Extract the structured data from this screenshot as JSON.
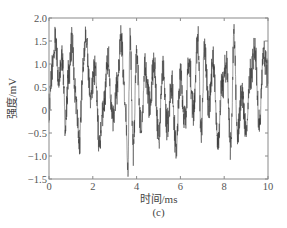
{
  "chart_data": {
    "type": "line",
    "title": "",
    "caption": "(c)",
    "xlabel": "时间/ms",
    "ylabel": "强度/mV",
    "xlim": [
      0,
      10
    ],
    "ylim": [
      -1.5,
      2.0
    ],
    "xticks": [
      0,
      2,
      4,
      6,
      8,
      10
    ],
    "xtick_labels": [
      "0",
      "2",
      "4",
      "6",
      "8",
      "10"
    ],
    "yticks": [
      -1.5,
      -1.0,
      -0.5,
      0,
      0.5,
      1.0,
      1.5,
      2.0
    ],
    "ytick_labels": [
      "-1.5",
      "-1.0",
      "-0.5",
      "0",
      "0.5",
      "1.0",
      "1.5",
      "2.0"
    ],
    "grid": false,
    "legend": null,
    "line_color": "#3a3a3a",
    "series": [
      {
        "name": "signal",
        "description": "Noisy oscillating voltage signal, mostly between -0.8 and 1.5 mV, peaks up to ~1.7 mV, dips to ~-1.3 mV",
        "envelope_points": [
          {
            "x": 0.0,
            "y": 0.0
          },
          {
            "x": 0.15,
            "y": 0.9
          },
          {
            "x": 0.3,
            "y": 1.5
          },
          {
            "x": 0.45,
            "y": 0.6
          },
          {
            "x": 0.6,
            "y": 1.2
          },
          {
            "x": 0.75,
            "y": -0.3
          },
          {
            "x": 0.9,
            "y": 0.8
          },
          {
            "x": 1.05,
            "y": 1.5
          },
          {
            "x": 1.2,
            "y": 0.3
          },
          {
            "x": 1.4,
            "y": -0.7
          },
          {
            "x": 1.55,
            "y": 1.0
          },
          {
            "x": 1.7,
            "y": 1.6
          },
          {
            "x": 1.9,
            "y": 0.2
          },
          {
            "x": 2.1,
            "y": 0.9
          },
          {
            "x": 2.3,
            "y": -0.7
          },
          {
            "x": 2.5,
            "y": 0.1
          },
          {
            "x": 2.7,
            "y": 1.1
          },
          {
            "x": 2.9,
            "y": -0.2
          },
          {
            "x": 3.1,
            "y": 0.5
          },
          {
            "x": 3.3,
            "y": 1.5
          },
          {
            "x": 3.5,
            "y": 0.0
          },
          {
            "x": 3.6,
            "y": -1.3
          },
          {
            "x": 3.7,
            "y": 1.7
          },
          {
            "x": 3.85,
            "y": -0.9
          },
          {
            "x": 4.0,
            "y": 1.2
          },
          {
            "x": 4.2,
            "y": -0.4
          },
          {
            "x": 4.4,
            "y": 0.9
          },
          {
            "x": 4.6,
            "y": 0.1
          },
          {
            "x": 4.8,
            "y": 1.0
          },
          {
            "x": 5.0,
            "y": -0.6
          },
          {
            "x": 5.2,
            "y": 0.8
          },
          {
            "x": 5.4,
            "y": -0.3
          },
          {
            "x": 5.6,
            "y": 0.6
          },
          {
            "x": 5.8,
            "y": -0.8
          },
          {
            "x": 6.0,
            "y": 0.7
          },
          {
            "x": 6.2,
            "y": -0.2
          },
          {
            "x": 6.4,
            "y": 1.0
          },
          {
            "x": 6.6,
            "y": 0.0
          },
          {
            "x": 6.8,
            "y": 1.6
          },
          {
            "x": 6.95,
            "y": -0.5
          },
          {
            "x": 7.1,
            "y": 1.3
          },
          {
            "x": 7.3,
            "y": 0.1
          },
          {
            "x": 7.5,
            "y": 1.1
          },
          {
            "x": 7.7,
            "y": -0.7
          },
          {
            "x": 7.9,
            "y": 0.5
          },
          {
            "x": 8.1,
            "y": 1.0
          },
          {
            "x": 8.3,
            "y": -0.8
          },
          {
            "x": 8.45,
            "y": 1.6
          },
          {
            "x": 8.6,
            "y": -0.6
          },
          {
            "x": 8.8,
            "y": 0.4
          },
          {
            "x": 9.0,
            "y": -0.5
          },
          {
            "x": 9.2,
            "y": 0.8
          },
          {
            "x": 9.4,
            "y": 1.3
          },
          {
            "x": 9.6,
            "y": -0.3
          },
          {
            "x": 9.8,
            "y": 1.2
          },
          {
            "x": 10.0,
            "y": 0.7
          }
        ]
      }
    ]
  },
  "plot_area": {
    "left": 49,
    "top": 18,
    "right": 268,
    "bottom": 179
  }
}
